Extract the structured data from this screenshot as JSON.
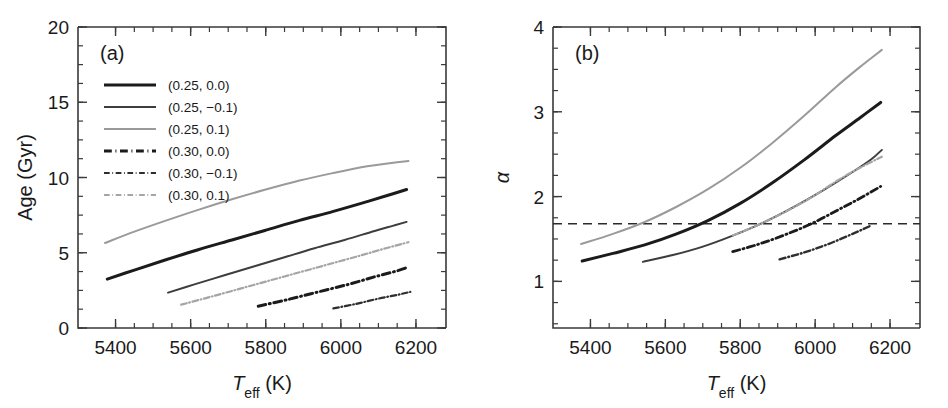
{
  "figure": {
    "width": 948,
    "height": 408,
    "background": "#ffffff"
  },
  "chart_data": [
    {
      "type": "line",
      "panel_tag": "(a)",
      "title": "",
      "xlabel": "T_eff (K)",
      "xlabel_parts": {
        "italic": "T",
        "sub": "eff",
        "rest": " (K)"
      },
      "ylabel": "Age (Gyr)",
      "xlim": [
        5300,
        6280
      ],
      "ylim": [
        0,
        20
      ],
      "xticks": [
        5400,
        5600,
        5800,
        6000,
        6200
      ],
      "xticklabels": [
        "5400",
        "5600",
        "5800",
        "6000",
        "6200"
      ],
      "yticks": [
        0,
        5,
        10,
        15,
        20
      ],
      "yticklabels": [
        "0",
        "5",
        "10",
        "15",
        "20"
      ],
      "x_minor_step": 50,
      "y_minor_step": 1.25,
      "grid": false,
      "legend_position": "upper-left",
      "series": [
        {
          "name": "(0.25, 0.0)",
          "style": "solid",
          "color": "#1b1b1b",
          "width": 3.0,
          "x": [
            5378,
            5450,
            5530,
            5620,
            5710,
            5800,
            5890,
            5980,
            6070,
            6130,
            6175
          ],
          "y": [
            3.25,
            3.85,
            4.5,
            5.2,
            5.85,
            6.5,
            7.15,
            7.75,
            8.4,
            8.85,
            9.2
          ]
        },
        {
          "name": "(0.25, −0.1)",
          "style": "solid",
          "color": "#3d3d3d",
          "width": 2.0,
          "x": [
            5540,
            5610,
            5690,
            5770,
            5850,
            5930,
            6010,
            6090,
            6140,
            6175
          ],
          "y": [
            2.35,
            2.9,
            3.5,
            4.1,
            4.7,
            5.3,
            5.85,
            6.45,
            6.8,
            7.05
          ]
        },
        {
          "name": "(0.25, 0.1)",
          "style": "solid",
          "color": "#9a9a9a",
          "width": 2.0,
          "x": [
            5372,
            5450,
            5530,
            5620,
            5710,
            5800,
            5890,
            5980,
            6070,
            6130,
            6180
          ],
          "y": [
            5.65,
            6.4,
            7.1,
            7.85,
            8.55,
            9.2,
            9.8,
            10.3,
            10.75,
            10.95,
            11.1
          ]
        },
        {
          "name": "(0.30, 0.0)",
          "style": "dashdot",
          "color": "#1b1b1b",
          "width": 3.0,
          "x": [
            5780,
            5860,
            5940,
            6020,
            6090,
            6150,
            6180
          ],
          "y": [
            1.45,
            1.9,
            2.4,
            2.9,
            3.4,
            3.8,
            4.05
          ]
        },
        {
          "name": "(0.30, −0.1)",
          "style": "dashdot",
          "color": "#2e2e2e",
          "width": 2.2,
          "x": [
            5980,
            6040,
            6100,
            6150,
            6185
          ],
          "y": [
            1.3,
            1.6,
            1.95,
            2.2,
            2.4
          ]
        },
        {
          "name": "(0.30, 0.1)",
          "style": "dashdot",
          "color": "#a5a5a5",
          "width": 2.2,
          "x": [
            5575,
            5650,
            5730,
            5810,
            5890,
            5970,
            6050,
            6120,
            6180
          ],
          "y": [
            1.55,
            2.05,
            2.6,
            3.15,
            3.7,
            4.25,
            4.8,
            5.3,
            5.7
          ]
        }
      ],
      "legend": [
        {
          "label": "(0.25, 0.0)",
          "style": "solid",
          "color": "#1b1b1b",
          "width": 3.0
        },
        {
          "label": "(0.25, −0.1)",
          "style": "solid",
          "color": "#3d3d3d",
          "width": 2.0
        },
        {
          "label": "(0.25, 0.1)",
          "style": "solid",
          "color": "#9a9a9a",
          "width": 2.0
        },
        {
          "label": "(0.30, 0.0)",
          "style": "dashdot",
          "color": "#1b1b1b",
          "width": 3.0
        },
        {
          "label": "(0.30, −0.1)",
          "style": "dashdot",
          "color": "#2e2e2e",
          "width": 2.2
        },
        {
          "label": "(0.30, 0.1)",
          "style": "dashdot",
          "color": "#a5a5a5",
          "width": 2.2
        }
      ]
    },
    {
      "type": "line",
      "panel_tag": "(b)",
      "title": "",
      "xlabel": "T_eff (K)",
      "xlabel_parts": {
        "italic": "T",
        "sub": "eff",
        "rest": " (K)"
      },
      "ylabel": "α",
      "xlim": [
        5300,
        6280
      ],
      "ylim": [
        0.45,
        4.0
      ],
      "xticks": [
        5400,
        5600,
        5800,
        6000,
        6200
      ],
      "xticklabels": [
        "5400",
        "5600",
        "5800",
        "6000",
        "6200"
      ],
      "yticks": [
        1,
        2,
        3,
        4
      ],
      "yticklabels": [
        "1",
        "2",
        "3",
        "4"
      ],
      "x_minor_step": 50,
      "y_minor_step": 0.25,
      "grid": false,
      "legend_position": "none",
      "annotations": [
        {
          "type": "hline",
          "value": 1.68,
          "style": "dashed",
          "color": "#2b2b2b"
        }
      ],
      "series": [
        {
          "name": "(0.25, 0.0)",
          "style": "solid",
          "color": "#1b1b1b",
          "width": 3.0,
          "x": [
            5378,
            5460,
            5545,
            5630,
            5715,
            5800,
            5885,
            5970,
            6055,
            6120,
            6175
          ],
          "y": [
            1.24,
            1.33,
            1.43,
            1.56,
            1.72,
            1.92,
            2.16,
            2.43,
            2.72,
            2.93,
            3.11
          ]
        },
        {
          "name": "(0.25, −0.1)",
          "style": "solid",
          "color": "#3d3d3d",
          "width": 2.0,
          "x": [
            5540,
            5620,
            5700,
            5780,
            5860,
            5940,
            6020,
            6100,
            6150,
            6178
          ],
          "y": [
            1.23,
            1.31,
            1.41,
            1.54,
            1.69,
            1.87,
            2.07,
            2.29,
            2.44,
            2.55
          ]
        },
        {
          "name": "(0.25, 0.1)",
          "style": "solid",
          "color": "#9a9a9a",
          "width": 2.0,
          "x": [
            5375,
            5460,
            5545,
            5630,
            5715,
            5800,
            5885,
            5970,
            6055,
            6120,
            6178
          ],
          "y": [
            1.44,
            1.56,
            1.7,
            1.88,
            2.09,
            2.34,
            2.63,
            2.95,
            3.29,
            3.53,
            3.73
          ]
        },
        {
          "name": "(0.30, 0.0)",
          "style": "dashdot",
          "color": "#1b1b1b",
          "width": 2.8,
          "x": [
            5780,
            5850,
            5920,
            5990,
            6060,
            6120,
            6175
          ],
          "y": [
            1.35,
            1.44,
            1.55,
            1.68,
            1.84,
            1.98,
            2.12
          ]
        },
        {
          "name": "(0.30, −0.1)",
          "style": "dashdot",
          "color": "#2e2e2e",
          "width": 2.4,
          "x": [
            5905,
            5970,
            6035,
            6100,
            6150
          ],
          "y": [
            1.26,
            1.34,
            1.44,
            1.56,
            1.66
          ]
        },
        {
          "name": "(0.30, 0.1)",
          "style": "dashdot",
          "color": "#a5a5a5",
          "width": 2.2,
          "x": [
            5780,
            5850,
            5920,
            5990,
            6060,
            6120,
            6178
          ],
          "y": [
            1.54,
            1.67,
            1.82,
            1.99,
            2.19,
            2.34,
            2.47
          ]
        }
      ],
      "legend": []
    }
  ]
}
